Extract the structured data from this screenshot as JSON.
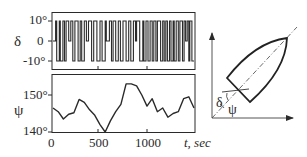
{
  "chart_data": [
    {
      "type": "line",
      "title": "",
      "xlabel": "",
      "ylabel": "δ",
      "ylim": [
        -12,
        12
      ],
      "yticks": [
        "10°",
        "0",
        "-10°"
      ],
      "description": "Rudder angle δ: square-wave switching between +10° and -10°, occasionally resting at 0",
      "x": [
        0,
        25,
        25,
        35,
        35,
        60,
        60,
        70,
        70,
        95,
        95,
        110,
        110,
        125,
        125,
        150,
        150,
        170,
        170,
        190,
        190,
        210,
        210,
        240,
        240,
        260,
        260,
        275,
        275,
        300,
        300,
        320,
        320,
        340,
        340,
        370,
        370,
        390,
        390,
        420,
        420,
        450,
        450,
        470,
        470,
        500,
        500,
        510,
        510,
        540,
        540,
        560,
        560,
        575,
        575,
        600,
        600,
        625,
        625,
        645,
        645,
        670,
        670,
        700,
        700,
        725,
        725,
        745,
        745,
        770,
        770,
        790,
        790,
        800,
        800,
        830,
        830,
        860,
        860,
        870,
        870,
        890,
        890,
        910,
        910,
        930,
        930,
        950,
        950,
        965,
        965,
        985,
        985,
        1000,
        1000,
        1030,
        1030,
        1050,
        1050,
        1065,
        1065,
        1080,
        1080,
        1095,
        1095,
        1115,
        1115,
        1130,
        1130,
        1150,
        1150,
        1160,
        1160,
        1180,
        1180,
        1200,
        1200,
        1215,
        1215,
        1240,
        1240,
        1255,
        1255,
        1270,
        1270,
        1285,
        1285,
        1300,
        1300,
        1310,
        1310,
        1330,
        1330,
        1350
      ],
      "values": [
        0,
        0,
        10,
        10,
        -10,
        -10,
        10,
        10,
        -10,
        -10,
        10,
        10,
        -10,
        -10,
        10,
        10,
        0,
        0,
        10,
        10,
        -10,
        -10,
        10,
        10,
        -10,
        -10,
        10,
        10,
        -10,
        -10,
        10,
        10,
        0,
        0,
        10,
        10,
        -10,
        -10,
        10,
        10,
        -10,
        -10,
        10,
        10,
        -10,
        -10,
        10,
        10,
        0,
        0,
        10,
        10,
        -10,
        -10,
        10,
        10,
        -10,
        -10,
        10,
        10,
        -10,
        -10,
        10,
        10,
        -10,
        -10,
        10,
        10,
        -10,
        -10,
        10,
        10,
        0,
        0,
        10,
        10,
        -10,
        -10,
        10,
        10,
        -10,
        -10,
        10,
        10,
        -10,
        -10,
        10,
        10,
        -10,
        -10,
        10,
        10,
        -10,
        -10,
        10,
        10,
        -10,
        -10,
        10,
        10,
        -10,
        -10,
        10,
        10,
        -10,
        -10,
        10,
        10,
        -10,
        -10,
        10,
        10,
        -10,
        -10,
        10,
        10,
        -10,
        -10,
        10,
        10,
        -10,
        -10,
        10,
        10,
        0,
        0,
        10,
        10,
        -10,
        -10,
        10,
        10,
        -10,
        -10,
        10,
        10
      ],
      "xlim": [
        0,
        1350
      ],
      "grid": false
    },
    {
      "type": "line",
      "title": "",
      "xlabel": "t, sec",
      "ylabel": "ψ",
      "ylim": [
        140,
        155
      ],
      "yticks": [
        "150°",
        "140°"
      ],
      "xticks": [
        "0",
        "500",
        "1000"
      ],
      "description": "Heading angle ψ over time",
      "x": [
        0,
        50,
        100,
        150,
        200,
        250,
        300,
        350,
        400,
        450,
        500,
        550,
        600,
        650,
        700,
        750,
        800,
        850,
        900,
        950,
        1000,
        1050,
        1100,
        1150,
        1200,
        1250,
        1300,
        1350
      ],
      "values": [
        146.5,
        145.5,
        143.5,
        144.8,
        145.2,
        148.8,
        148.0,
        146.0,
        144.5,
        142.0,
        140.0,
        143.0,
        145.5,
        147.5,
        153.0,
        153.0,
        152.5,
        150.0,
        147.0,
        149.0,
        145.5,
        146.5,
        144.0,
        145.0,
        145.5,
        149.0,
        149.5,
        146.5
      ],
      "xlim": [
        0,
        1350
      ],
      "grid": false
    }
  ],
  "labels": {
    "delta_axis": "δ",
    "delta_tick_top": "10°",
    "delta_tick_mid": "0",
    "delta_tick_bot": "-10°",
    "psi_axis": "ψ",
    "psi_tick_top": "150°",
    "psi_tick_bot": "140°",
    "x_tick_0": "0",
    "x_tick_500": "500",
    "x_tick_1000": "1000",
    "x_axis_label": "t, sec",
    "diagram_delta": "δ",
    "diagram_psi": "ψ"
  },
  "colors": {
    "ink": "#2a2a2a",
    "background": "#ffffff"
  }
}
